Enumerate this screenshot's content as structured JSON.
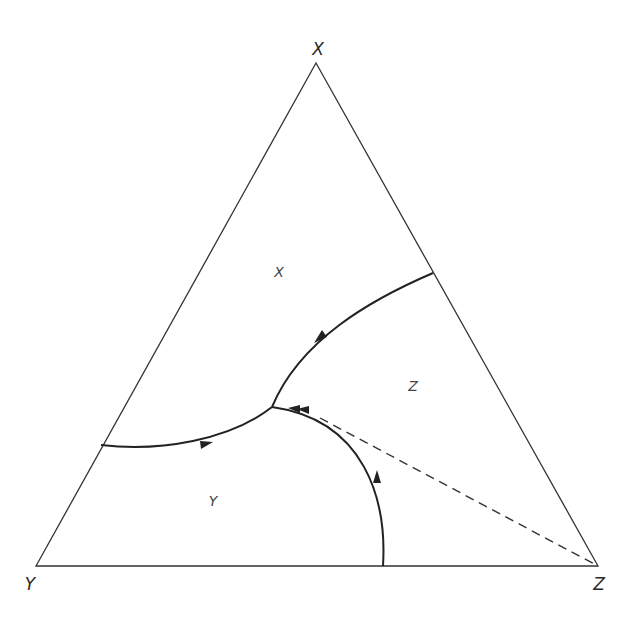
{
  "diagram": {
    "type": "ternary-phase-diagram",
    "vertices": {
      "top": {
        "label": "X"
      },
      "bottom_left": {
        "label": "Y"
      },
      "bottom_right": {
        "label": "Z"
      }
    },
    "regions": [
      {
        "id": "x-field",
        "label": "X"
      },
      {
        "id": "z-field",
        "label": "Z"
      },
      {
        "id": "y-field",
        "label": "Y"
      }
    ],
    "boundary_curves": [
      {
        "id": "x-z-boundary",
        "from": "right edge",
        "to": "ternary point",
        "arrow": "toward ternary point"
      },
      {
        "id": "x-y-boundary",
        "from": "left edge",
        "to": "ternary point",
        "arrow": "toward ternary point"
      },
      {
        "id": "y-z-boundary",
        "from": "bottom edge",
        "to": "ternary point",
        "arrow": "toward ternary point"
      }
    ],
    "ternary_point": {
      "marker": "double-arrow"
    },
    "dashed_line": {
      "from": "ternary point",
      "to": "Z vertex"
    },
    "colors": {
      "line": "#222222",
      "background": "#ffffff"
    }
  }
}
